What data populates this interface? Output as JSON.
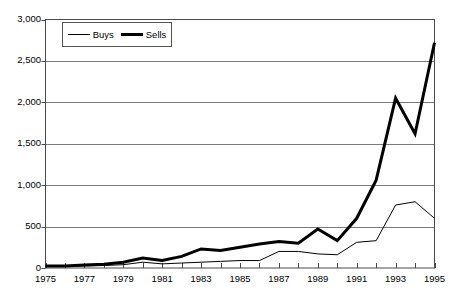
{
  "chart_data": {
    "type": "line",
    "title": "",
    "subtitle": "",
    "xlabel": "",
    "ylabel": "",
    "x": [
      1975,
      1976,
      1977,
      1978,
      1979,
      1980,
      1981,
      1982,
      1983,
      1984,
      1985,
      1986,
      1987,
      1988,
      1989,
      1990,
      1991,
      1992,
      1993,
      1994,
      1995
    ],
    "xlim": [
      1975,
      1995
    ],
    "ylim": [
      0,
      3000
    ],
    "xtick_labels": [
      "1975",
      "1977",
      "1979",
      "1981",
      "1983",
      "1985",
      "1987",
      "1989",
      "1991",
      "1993",
      "1995"
    ],
    "xtick_values": [
      1975,
      1977,
      1979,
      1981,
      1983,
      1985,
      1987,
      1989,
      1991,
      1993,
      1995
    ],
    "xtick_minor_values": [
      1976,
      1978,
      1980,
      1982,
      1984,
      1986,
      1988,
      1990,
      1992,
      1994
    ],
    "ytick_labels": [
      "0",
      "500",
      "1,000",
      "1,500",
      "2,000",
      "2,500",
      "3,000"
    ],
    "ytick_values": [
      0,
      500,
      1000,
      1500,
      2000,
      2500,
      3000
    ],
    "grid": "horizontal",
    "legend_position": "top-left-inside",
    "series": [
      {
        "name": "Buys",
        "style": "thin",
        "color": "#000000",
        "width": 1,
        "values": [
          20,
          20,
          25,
          30,
          40,
          70,
          50,
          60,
          70,
          80,
          90,
          90,
          200,
          200,
          170,
          160,
          310,
          330,
          760,
          800,
          600
        ]
      },
      {
        "name": "Sells",
        "style": "thick",
        "color": "#000000",
        "width": 3,
        "values": [
          25,
          25,
          35,
          45,
          70,
          120,
          90,
          140,
          230,
          210,
          250,
          290,
          320,
          300,
          470,
          330,
          600,
          1060,
          2050,
          1620,
          2720
        ]
      }
    ]
  },
  "legend": {
    "items": [
      {
        "label": "Buys",
        "swatch": "thin-line-swatch"
      },
      {
        "label": "Sells",
        "swatch": "thick-line-swatch"
      }
    ]
  },
  "colors": {
    "line": "#000000",
    "grid": "#7a7a7a",
    "axis": "#4a4a4a",
    "background": "#ffffff"
  }
}
